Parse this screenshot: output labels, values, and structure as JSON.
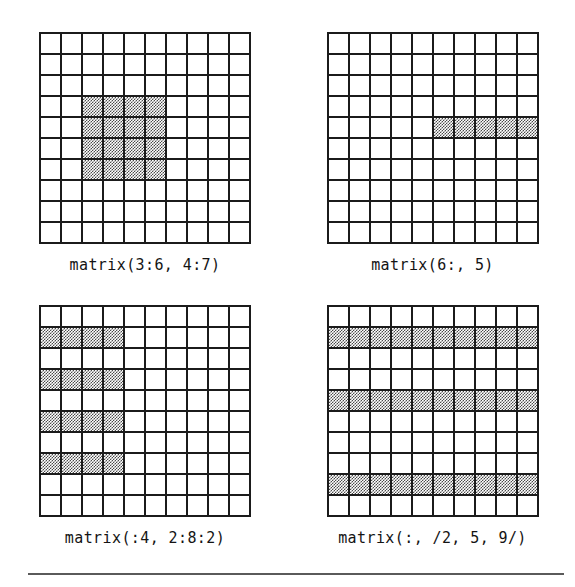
{
  "figure": {
    "rows": 10,
    "cols": 10,
    "shade_color": "#4a4a4a",
    "line_color": "#1b1b1b",
    "rule_color": "#5a5a5a",
    "panels": [
      {
        "id": "panel-1",
        "name": "matrix-3-6-4-7",
        "label": "matrix(3:6, 4:7)",
        "shaded_cols": [
          3,
          4,
          5,
          6
        ],
        "shaded_rows": [
          4,
          5,
          6,
          7
        ],
        "shaded_cells": [
          [
            4,
            3
          ],
          [
            4,
            4
          ],
          [
            4,
            5
          ],
          [
            4,
            6
          ],
          [
            5,
            3
          ],
          [
            5,
            4
          ],
          [
            5,
            5
          ],
          [
            5,
            6
          ],
          [
            6,
            3
          ],
          [
            6,
            4
          ],
          [
            6,
            5
          ],
          [
            6,
            6
          ],
          [
            7,
            3
          ],
          [
            7,
            4
          ],
          [
            7,
            5
          ],
          [
            7,
            6
          ]
        ]
      },
      {
        "id": "panel-2",
        "name": "matrix-6-colon-5",
        "label": "matrix(6:, 5)",
        "shaded_cols": [
          6,
          7,
          8,
          9,
          10
        ],
        "shaded_rows": [
          5
        ],
        "shaded_cells": [
          [
            5,
            6
          ],
          [
            5,
            7
          ],
          [
            5,
            8
          ],
          [
            5,
            9
          ],
          [
            5,
            10
          ]
        ]
      },
      {
        "id": "panel-3",
        "name": "matrix-colon4-2-8-2",
        "label": "matrix(:4, 2:8:2)",
        "shaded_cols": [
          1,
          2,
          3,
          4
        ],
        "shaded_rows": [
          2,
          4,
          6,
          8
        ],
        "shaded_cells": [
          [
            2,
            1
          ],
          [
            2,
            2
          ],
          [
            2,
            3
          ],
          [
            2,
            4
          ],
          [
            4,
            1
          ],
          [
            4,
            2
          ],
          [
            4,
            3
          ],
          [
            4,
            4
          ],
          [
            6,
            1
          ],
          [
            6,
            2
          ],
          [
            6,
            3
          ],
          [
            6,
            4
          ],
          [
            8,
            1
          ],
          [
            8,
            2
          ],
          [
            8,
            3
          ],
          [
            8,
            4
          ]
        ]
      },
      {
        "id": "panel-4",
        "name": "matrix-colon-2-5-9",
        "label": "matrix(:, /2, 5, 9/)",
        "shaded_cols": [
          1,
          2,
          3,
          4,
          5,
          6,
          7,
          8,
          9,
          10
        ],
        "shaded_rows": [
          2,
          5,
          9
        ],
        "shaded_cells": [
          [
            2,
            1
          ],
          [
            2,
            2
          ],
          [
            2,
            3
          ],
          [
            2,
            4
          ],
          [
            2,
            5
          ],
          [
            2,
            6
          ],
          [
            2,
            7
          ],
          [
            2,
            8
          ],
          [
            2,
            9
          ],
          [
            2,
            10
          ],
          [
            5,
            1
          ],
          [
            5,
            2
          ],
          [
            5,
            3
          ],
          [
            5,
            4
          ],
          [
            5,
            5
          ],
          [
            5,
            6
          ],
          [
            5,
            7
          ],
          [
            5,
            8
          ],
          [
            5,
            9
          ],
          [
            5,
            10
          ],
          [
            9,
            1
          ],
          [
            9,
            2
          ],
          [
            9,
            3
          ],
          [
            9,
            4
          ],
          [
            9,
            5
          ],
          [
            9,
            6
          ],
          [
            9,
            7
          ],
          [
            9,
            8
          ],
          [
            9,
            9
          ],
          [
            9,
            10
          ]
        ]
      }
    ]
  }
}
